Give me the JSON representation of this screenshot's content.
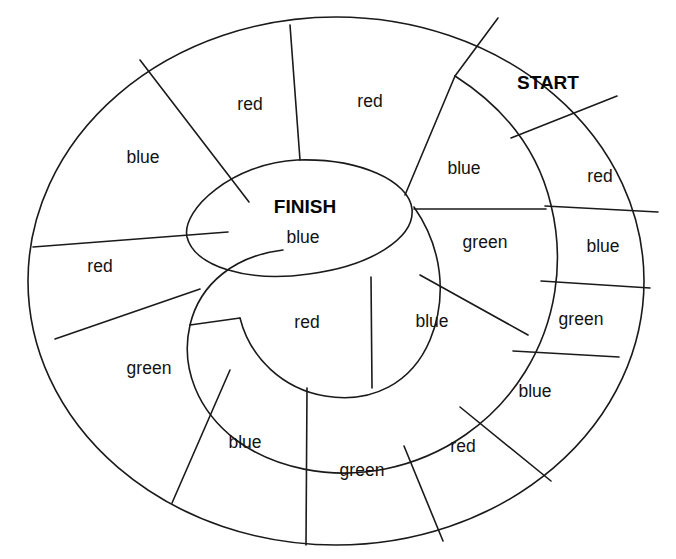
{
  "board": {
    "title": "Spiral board game track",
    "start_label": "START",
    "finish_label": "FINISH",
    "stroke_color": "#1a1a1a",
    "background_color": "#ffffff",
    "text_color": "#121212"
  },
  "center": {
    "name_label": "FINISH",
    "color_label": "blue"
  },
  "cells": [
    {
      "id": "start",
      "label": "START",
      "bold": true,
      "x": 548,
      "y": 84,
      "ring": "outer"
    },
    {
      "id": "outer-red-1",
      "label": "red",
      "bold": false,
      "x": 600,
      "y": 177,
      "ring": "outer"
    },
    {
      "id": "outer-blue-1",
      "label": "blue",
      "bold": false,
      "x": 603,
      "y": 247,
      "ring": "outer"
    },
    {
      "id": "outer-green-1",
      "label": "green",
      "bold": false,
      "x": 581,
      "y": 320,
      "ring": "outer"
    },
    {
      "id": "outer-blue-2",
      "label": "blue",
      "bold": false,
      "x": 535,
      "y": 392,
      "ring": "outer"
    },
    {
      "id": "outer-red-2",
      "label": "red",
      "bold": false,
      "x": 463,
      "y": 447,
      "ring": "outer"
    },
    {
      "id": "outer-green-2",
      "label": "green",
      "bold": false,
      "x": 362,
      "y": 471,
      "ring": "outer"
    },
    {
      "id": "outer-blue-3",
      "label": "blue",
      "bold": false,
      "x": 245,
      "y": 443,
      "ring": "outer"
    },
    {
      "id": "outer-green-3",
      "label": "green",
      "bold": false,
      "x": 149,
      "y": 369,
      "ring": "outer"
    },
    {
      "id": "outer-red-3",
      "label": "red",
      "bold": false,
      "x": 100,
      "y": 267,
      "ring": "outer"
    },
    {
      "id": "outer-blue-4",
      "label": "blue",
      "bold": false,
      "x": 143,
      "y": 158,
      "ring": "outer"
    },
    {
      "id": "outer-red-4",
      "label": "red",
      "bold": false,
      "x": 250,
      "y": 105,
      "ring": "outer"
    },
    {
      "id": "outer-red-5",
      "label": "red",
      "bold": false,
      "x": 370,
      "y": 102,
      "ring": "outer"
    },
    {
      "id": "inner-blue-1",
      "label": "blue",
      "bold": false,
      "x": 464,
      "y": 169,
      "ring": "inner"
    },
    {
      "id": "inner-green-1",
      "label": "green",
      "bold": false,
      "x": 485,
      "y": 243,
      "ring": "inner"
    },
    {
      "id": "inner-blue-2",
      "label": "blue",
      "bold": false,
      "x": 432,
      "y": 322,
      "ring": "inner"
    },
    {
      "id": "inner-red-1",
      "label": "red",
      "bold": false,
      "x": 307,
      "y": 323,
      "ring": "inner"
    }
  ]
}
